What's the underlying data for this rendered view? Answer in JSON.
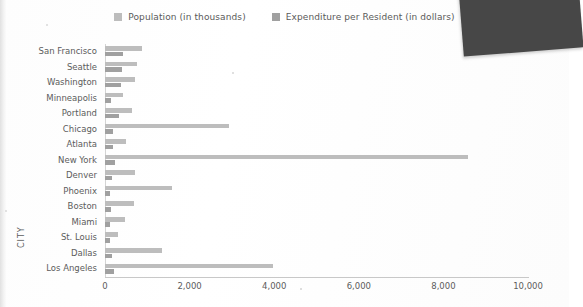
{
  "chart_data": {
    "type": "bar",
    "orientation": "horizontal",
    "title": "",
    "xlabel": "",
    "ylabel": "CITY",
    "xlim": [
      0,
      10000
    ],
    "xticks": [
      "0",
      "2,000",
      "4,000",
      "6,000",
      "8,000",
      "10,000"
    ],
    "xtick_values": [
      0,
      2000,
      4000,
      6000,
      8000,
      10000
    ],
    "grid": false,
    "legend_position": "top-center",
    "categories": [
      "San Francisco",
      "Seattle",
      "Washington",
      "Minneapolis",
      "Portland",
      "Chicago",
      "Atlanta",
      "New York",
      "Denver",
      "Phoenix",
      "Boston",
      "Miami",
      "St. Louis",
      "Dallas",
      "Los Angeles"
    ],
    "series": [
      {
        "name": "Population (in thousands)",
        "color": "#bdbdbd",
        "values": [
          880,
          750,
          710,
          430,
          650,
          2930,
          500,
          8580,
          720,
          1580,
          690,
          470,
          300,
          1340,
          3970
        ]
      },
      {
        "name": "Expenditure per Resident (in dollars)",
        "color": "#a0a0a0",
        "values": [
          430,
          400,
          380,
          150,
          330,
          200,
          180,
          230,
          170,
          120,
          140,
          120,
          110,
          160,
          210
        ]
      }
    ]
  },
  "legend": {
    "items": [
      {
        "label": "Population (in thousands)",
        "color": "#bdbdbd"
      },
      {
        "label": "Expenditure per Resident (in dollars)",
        "color": "#a0a0a0"
      }
    ]
  },
  "axes": {
    "y_axis_title": "CITY"
  }
}
